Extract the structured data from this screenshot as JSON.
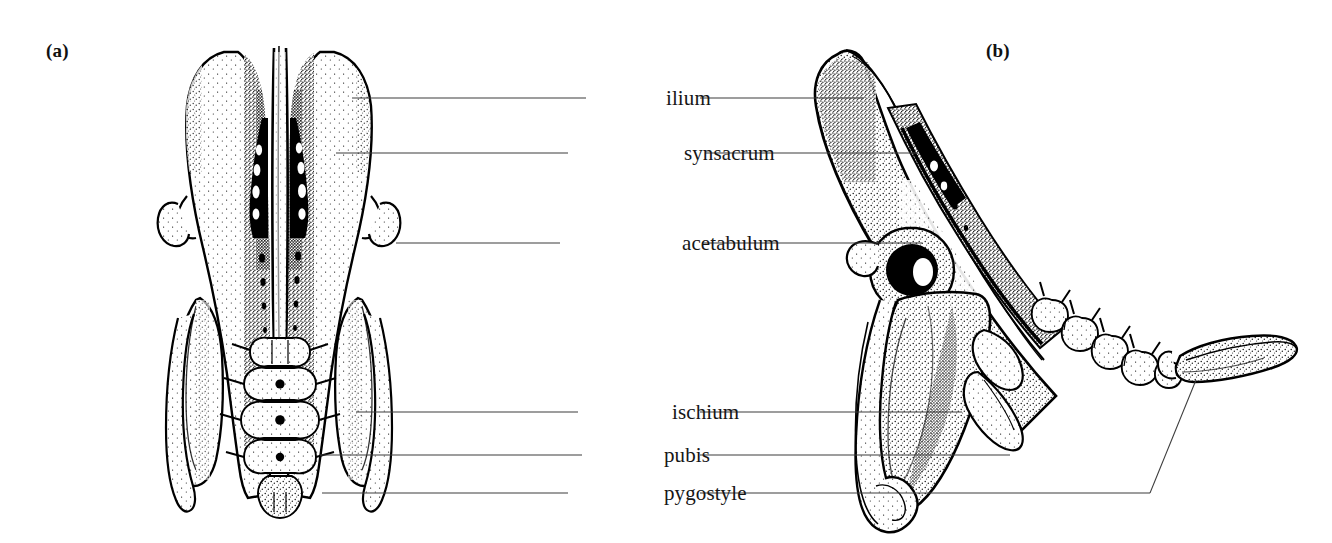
{
  "figure": {
    "background_color": "#ffffff",
    "ink_color": "#000000",
    "leader_line_color": "#3c3c3c",
    "panels": [
      {
        "id": "a",
        "letter": "(a)",
        "view": "dorsal"
      },
      {
        "id": "b",
        "letter": "(b)",
        "view": "lateral"
      }
    ]
  },
  "labels": [
    {
      "name": "ilium",
      "text": "ilium",
      "y": 98,
      "text_x": 666,
      "left_line": {
        "x1": 352,
        "x2": 586
      },
      "right_line": {
        "x1": 700,
        "x2": 864
      }
    },
    {
      "name": "synsacrum",
      "text": "synsacrum",
      "y": 153,
      "text_x": 684,
      "left_line": {
        "x1": 336,
        "x2": 568
      },
      "right_line": {
        "x1": 705,
        "x2": 918
      }
    },
    {
      "name": "acetabulum",
      "text": "acetabulum",
      "y": 243,
      "text_x": 682,
      "left_line": {
        "x1": 396,
        "x2": 560
      },
      "right_line": {
        "x1": 702,
        "x2": 922
      }
    },
    {
      "name": "ischium",
      "text": "ischium",
      "y": 412,
      "text_x": 672,
      "left_line": {
        "x1": 356,
        "x2": 578
      },
      "right_line": {
        "x1": 700,
        "x2": 962
      }
    },
    {
      "name": "pubis",
      "text": "pubis",
      "y": 455,
      "text_x": 664,
      "left_line": {
        "x1": 320,
        "x2": 582
      },
      "right_line": {
        "x1": 700,
        "x2": 1010
      }
    },
    {
      "name": "pygostyle",
      "text": "pygostyle",
      "y": 493,
      "text_x": 664,
      "left_line": {
        "x1": 322,
        "x2": 568
      },
      "right_line": {
        "x1": 700,
        "x2": 1150
      },
      "elbow": {
        "x": 1150,
        "y": 493,
        "x2": 1196,
        "y2": 380
      }
    }
  ]
}
